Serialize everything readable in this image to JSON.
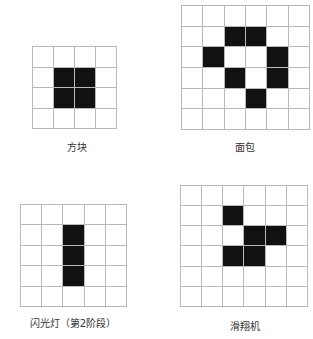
{
  "figure": {
    "patterns": [
      {
        "id": "block",
        "label": "方块",
        "rows": 4,
        "cols": 4,
        "alive": [
          [
            1,
            1
          ],
          [
            1,
            2
          ],
          [
            2,
            1
          ],
          [
            2,
            2
          ]
        ],
        "grid_box": {
          "x": 32,
          "y": 46,
          "w": 85,
          "h": 83
        },
        "label_pos": {
          "cx": 77,
          "y": 139
        }
      },
      {
        "id": "loaf",
        "label": "面包",
        "rows": 6,
        "cols": 6,
        "alive": [
          [
            1,
            2
          ],
          [
            1,
            3
          ],
          [
            2,
            1
          ],
          [
            2,
            4
          ],
          [
            3,
            2
          ],
          [
            3,
            4
          ],
          [
            4,
            3
          ]
        ],
        "grid_box": {
          "x": 181,
          "y": 5,
          "w": 129,
          "h": 125
        },
        "label_pos": {
          "cx": 245,
          "y": 139
        }
      },
      {
        "id": "blinker",
        "label": "闪光灯（第2阶段）",
        "rows": 5,
        "cols": 5,
        "alive": [
          [
            1,
            2
          ],
          [
            2,
            2
          ],
          [
            3,
            2
          ]
        ],
        "grid_box": {
          "x": 20,
          "y": 204,
          "w": 107,
          "h": 103
        },
        "label_pos": {
          "cx": 73,
          "y": 315
        }
      },
      {
        "id": "glider",
        "label": "滑翔机",
        "rows": 6,
        "cols": 6,
        "alive": [
          [
            1,
            2
          ],
          [
            2,
            3
          ],
          [
            2,
            4
          ],
          [
            3,
            2
          ],
          [
            3,
            3
          ]
        ],
        "grid_box": {
          "x": 180,
          "y": 185,
          "w": 128,
          "h": 122
        },
        "label_pos": {
          "cx": 245,
          "y": 318
        }
      }
    ],
    "colors": {
      "alive": "#111111",
      "dead": "#ffffff",
      "grid_line": "#b8b8b8",
      "label": "#333333"
    }
  }
}
